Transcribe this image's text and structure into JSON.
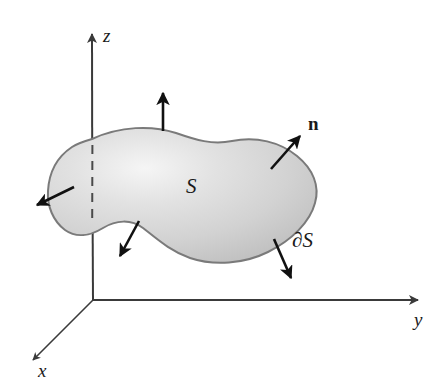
{
  "figure": {
    "background_color": "#ffffff"
  },
  "axes": {
    "origin": {
      "x": 93,
      "y": 300
    },
    "color": "#3a3a3a",
    "items": [
      {
        "name": "z-axis",
        "label": "z",
        "direction": "up",
        "tip": {
          "x": 92,
          "y": 25
        },
        "hidden_segment": {
          "from_y": 145,
          "to_y": 217,
          "style": "dashed"
        }
      },
      {
        "name": "y-axis",
        "label": "y",
        "direction": "right",
        "tip": {
          "x": 427,
          "y": 300
        }
      },
      {
        "name": "x-axis",
        "label": "x",
        "direction": "down-left",
        "tip": {
          "x": 26,
          "y": 366
        }
      }
    ]
  },
  "surface": {
    "label": "S",
    "boundary_label": "∂S",
    "normal_label": "n",
    "fill_light": "#f2f2f2",
    "fill_mid": "#d8d8d8",
    "fill_dark": "#b9b9b9",
    "outline_color": "#7a7a7a",
    "outline_width": 2
  },
  "normal_vectors": {
    "color": "#111111",
    "count": 5,
    "items": [
      {
        "name": "normal-arrow-top",
        "from": {
          "x": 163,
          "y": 131
        },
        "to": {
          "x": 163,
          "y": 88
        }
      },
      {
        "name": "normal-arrow-upper-right",
        "from": {
          "x": 271,
          "y": 169
        },
        "to": {
          "x": 304,
          "y": 131
        }
      },
      {
        "name": "normal-arrow-left",
        "from": {
          "x": 74,
          "y": 187
        },
        "to": {
          "x": 32,
          "y": 207
        }
      },
      {
        "name": "normal-arrow-lower-left",
        "from": {
          "x": 139,
          "y": 221
        },
        "to": {
          "x": 117,
          "y": 261
        }
      },
      {
        "name": "normal-arrow-lower-right",
        "from": {
          "x": 274,
          "y": 239
        },
        "to": {
          "x": 293,
          "y": 283
        }
      }
    ]
  }
}
